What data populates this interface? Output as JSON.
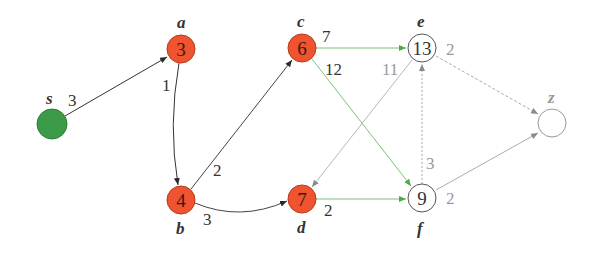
{
  "colors": {
    "visited": "#F0532F",
    "source": "#3C9B48",
    "unvisited_fill": "#ffffff",
    "tree_edge": "#2b2b2b",
    "green_edge": "#6fbf6a",
    "gray_edge": "#a8a8a8"
  },
  "nodes": [
    {
      "id": "s",
      "label": "s",
      "value": "",
      "state": "source",
      "x": 52,
      "y": 124
    },
    {
      "id": "a",
      "label": "a",
      "value": "3",
      "state": "visited",
      "x": 181,
      "y": 49
    },
    {
      "id": "b",
      "label": "b",
      "value": "4",
      "state": "visited",
      "x": 181,
      "y": 200
    },
    {
      "id": "c",
      "label": "c",
      "value": "6",
      "state": "visited",
      "x": 302,
      "y": 48
    },
    {
      "id": "d",
      "label": "d",
      "value": "7",
      "state": "visited",
      "x": 302,
      "y": 199
    },
    {
      "id": "e",
      "label": "e",
      "value": "13",
      "state": "unvisited",
      "x": 422,
      "y": 48
    },
    {
      "id": "f",
      "label": "f",
      "value": "9",
      "state": "unvisited",
      "x": 422,
      "y": 198
    },
    {
      "id": "z",
      "label": "z",
      "value": "",
      "state": "unvisited",
      "x": 552,
      "y": 123
    }
  ],
  "edges": [
    {
      "from": "s",
      "to": "a",
      "weight": "3",
      "style": "tree"
    },
    {
      "from": "a",
      "to": "b",
      "weight": "1",
      "style": "tree"
    },
    {
      "from": "b",
      "to": "c",
      "weight": "2",
      "style": "tree"
    },
    {
      "from": "b",
      "to": "d",
      "weight": "3",
      "style": "tree"
    },
    {
      "from": "c",
      "to": "e",
      "weight": "7",
      "style": "green"
    },
    {
      "from": "c",
      "to": "f",
      "weight": "12",
      "style": "green"
    },
    {
      "from": "d",
      "to": "f",
      "weight": "2",
      "style": "green"
    },
    {
      "from": "e",
      "to": "d",
      "weight": "11",
      "style": "gray"
    },
    {
      "from": "f",
      "to": "e",
      "weight": "3",
      "style": "gray-dashed"
    },
    {
      "from": "e",
      "to": "z",
      "weight": "2",
      "style": "gray-dashed"
    },
    {
      "from": "f",
      "to": "z",
      "weight": "2",
      "style": "gray"
    }
  ],
  "labels": {
    "s": "s",
    "a": "a",
    "b": "b",
    "c": "c",
    "d": "d",
    "e": "e",
    "f": "f",
    "z": "z",
    "a_val": "3",
    "b_val": "4",
    "c_val": "6",
    "d_val": "7",
    "e_val": "13",
    "f_val": "9",
    "w_sa": "3",
    "w_ab": "1",
    "w_bc": "2",
    "w_bd": "3",
    "w_ce": "7",
    "w_cf": "12",
    "w_df": "2",
    "w_ed": "11",
    "w_fe": "3",
    "w_ez": "2",
    "w_fz": "2"
  }
}
